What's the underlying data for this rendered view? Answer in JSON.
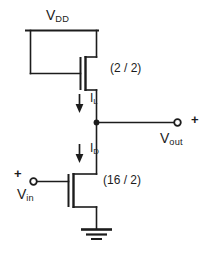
{
  "diagram": {
    "type": "schematic",
    "background_color": "#ffffff",
    "line_color": "#1c1c1c"
  },
  "labels": {
    "supply_rail": {
      "symbol": "V",
      "subscript": "DD"
    },
    "output_terminal": {
      "symbol": "V",
      "subscript": "out",
      "polarity": "+"
    },
    "input_terminal": {
      "symbol": "V",
      "subscript": "in",
      "polarity": "+"
    },
    "load_current": {
      "symbol": "I",
      "subscript": "L"
    },
    "drive_current": {
      "symbol": "I",
      "subscript": "D"
    }
  },
  "devices": {
    "load_transistor": {
      "name": "load-transistor",
      "ratio_label": "(2 / 2)",
      "width": 2,
      "length": 2
    },
    "driver_transistor": {
      "name": "driver-transistor",
      "ratio_label": "(16 / 2)",
      "width": 16,
      "length": 2
    }
  },
  "nodes": {
    "output_node_label": "output-node",
    "ground_label": "ground"
  }
}
